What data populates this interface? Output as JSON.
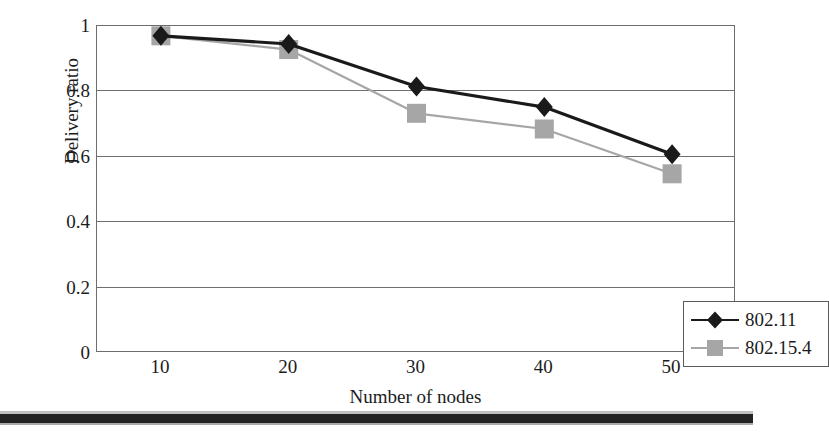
{
  "chart_data": {
    "type": "line",
    "title": "",
    "xlabel": "Number of nodes",
    "ylabel": "Delivery ratio",
    "x": [
      10,
      20,
      30,
      40,
      50
    ],
    "xtick_labels": [
      "10",
      "20",
      "30",
      "40",
      "50"
    ],
    "ytick_labels": [
      "0",
      "0.2",
      "0.4",
      "0.6",
      "0.8",
      "1"
    ],
    "ytick_values": [
      0,
      0.2,
      0.4,
      0.6,
      0.8,
      1
    ],
    "xlim": [
      5,
      55
    ],
    "ylim": [
      0,
      1
    ],
    "grid": "horizontal",
    "legend_position": "bottom-right",
    "series": [
      {
        "name": "802.11",
        "marker": "diamond",
        "color": "#1a1a1a",
        "values": [
          0.97,
          0.945,
          0.815,
          0.752,
          0.608
        ]
      },
      {
        "name": "802.15.4",
        "marker": "square",
        "color": "#a6a6a6",
        "values": [
          0.97,
          0.928,
          0.733,
          0.685,
          0.548
        ]
      }
    ]
  },
  "axes": {
    "y_title": "Delivery ratio",
    "x_title": "Number of nodes",
    "y_ticks": [
      "1",
      "0.8",
      "0.6",
      "0.4",
      "0.2",
      "0"
    ],
    "x_ticks": [
      "10",
      "20",
      "30",
      "40",
      "50"
    ]
  },
  "legend": {
    "entries": [
      {
        "label": "802.11",
        "marker": "diamond",
        "color": "#1a1a1a",
        "line_color": "#1a1a1a"
      },
      {
        "label": "802.15.4",
        "marker": "square",
        "color": "#a6a6a6",
        "line_color": "#a6a6a6"
      }
    ]
  },
  "colors": {
    "series_1": "#1a1a1a",
    "series_2": "#a6a6a6",
    "axis": "#6d6d6d",
    "grid": "#6f6f6f",
    "text": "#1c1c1c",
    "background": "#ffffff"
  }
}
